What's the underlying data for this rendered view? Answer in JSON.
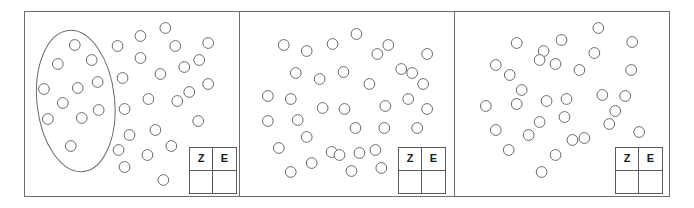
{
  "figure": {
    "title": "",
    "background_color": "#ffffff",
    "border_color": "#6e6e6e",
    "circle_stroke_color": "#6b6b6b",
    "circle_fill_color": "#ffffff",
    "circle_radius": 5.4
  },
  "score_table": {
    "headers": [
      "Z",
      "E"
    ],
    "values": [
      "",
      ""
    ],
    "header_z": "Z",
    "header_e": "E",
    "cell_z": "",
    "cell_e": ""
  },
  "panels": [
    {
      "name": "panel-1",
      "has_grouping_ellipse": true,
      "ellipse": {
        "cx": 74,
        "cy": 100,
        "rx": 39,
        "ry": 72,
        "rotation": -6
      },
      "circles_inside_ellipse": [
        [
          75,
          45
        ],
        [
          58,
          64
        ],
        [
          92,
          60
        ],
        [
          44,
          89
        ],
        [
          78,
          88
        ],
        [
          98,
          82
        ],
        [
          63,
          103
        ],
        [
          99,
          110
        ],
        [
          48,
          119
        ],
        [
          82,
          118
        ],
        [
          71,
          146
        ]
      ],
      "circles_outside_ellipse": [
        [
          141,
          36
        ],
        [
          118,
          46
        ],
        [
          166,
          28
        ],
        [
          141,
          58
        ],
        [
          176,
          46
        ],
        [
          161,
          74
        ],
        [
          123,
          78
        ],
        [
          185,
          67
        ],
        [
          149,
          99
        ],
        [
          200,
          60
        ],
        [
          190,
          92
        ],
        [
          125,
          109
        ],
        [
          178,
          101
        ],
        [
          156,
          130
        ],
        [
          130,
          135
        ],
        [
          199,
          121
        ],
        [
          148,
          155
        ],
        [
          119,
          150
        ],
        [
          172,
          146
        ],
        [
          125,
          167
        ],
        [
          164,
          180
        ],
        [
          209,
          43
        ],
        [
          209,
          84
        ]
      ],
      "count_inside": 11,
      "count_outside": 23,
      "count_total": 34
    },
    {
      "name": "panel-2",
      "has_grouping_ellipse": false,
      "circles_inside_ellipse": [],
      "circles_outside_ellipse": [
        [
          284,
          45
        ],
        [
          307,
          51
        ],
        [
          333,
          44
        ],
        [
          357,
          34
        ],
        [
          378,
          54
        ],
        [
          389,
          45
        ],
        [
          296,
          73
        ],
        [
          320,
          79
        ],
        [
          344,
          72
        ],
        [
          370,
          84
        ],
        [
          402,
          69
        ],
        [
          413,
          73
        ],
        [
          428,
          54
        ],
        [
          424,
          84
        ],
        [
          268,
          96
        ],
        [
          291,
          99
        ],
        [
          323,
          108
        ],
        [
          345,
          109
        ],
        [
          386,
          106
        ],
        [
          409,
          99
        ],
        [
          268,
          121
        ],
        [
          298,
          120
        ],
        [
          356,
          128
        ],
        [
          385,
          128
        ],
        [
          418,
          128
        ],
        [
          307,
          137
        ],
        [
          279,
          148
        ],
        [
          332,
          152
        ],
        [
          340,
          155
        ],
        [
          360,
          153
        ],
        [
          312,
          163
        ],
        [
          382,
          168
        ],
        [
          291,
          172
        ],
        [
          376,
          150
        ],
        [
          428,
          109
        ],
        [
          352,
          171
        ]
      ],
      "count_inside": 0,
      "count_outside": 36,
      "count_total": 36
    },
    {
      "name": "panel-3",
      "has_grouping_ellipse": false,
      "circles_inside_ellipse": [],
      "circles_outside_ellipse": [
        [
          518,
          43
        ],
        [
          545,
          51
        ],
        [
          563,
          40
        ],
        [
          600,
          28
        ],
        [
          596,
          53
        ],
        [
          634,
          42
        ],
        [
          497,
          65
        ],
        [
          557,
          64
        ],
        [
          581,
          70
        ],
        [
          633,
          70
        ],
        [
          511,
          75
        ],
        [
          541,
          60
        ],
        [
          523,
          90
        ],
        [
          548,
          101
        ],
        [
          568,
          99
        ],
        [
          487,
          106
        ],
        [
          518,
          104
        ],
        [
          604,
          95
        ],
        [
          627,
          96
        ],
        [
          541,
          122
        ],
        [
          566,
          117
        ],
        [
          611,
          124
        ],
        [
          641,
          132
        ],
        [
          497,
          130
        ],
        [
          530,
          135
        ],
        [
          586,
          138
        ],
        [
          574,
          140
        ],
        [
          557,
          155
        ],
        [
          510,
          150
        ],
        [
          543,
          172
        ],
        [
          617,
          111
        ]
      ],
      "count_inside": 0,
      "count_outside": 31,
      "count_total": 31
    }
  ]
}
